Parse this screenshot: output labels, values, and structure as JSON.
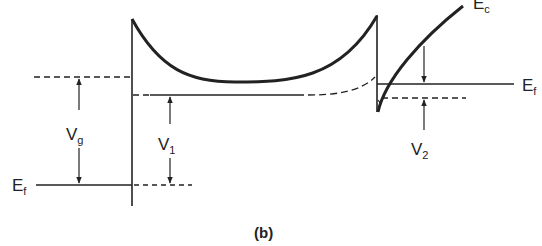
{
  "figure": {
    "caption": "(b)",
    "labels": {
      "vg_main": "V",
      "vg_sub": "g",
      "v1_main": "V",
      "v1_sub": "1",
      "v2_main": "V",
      "v2_sub": "2",
      "ef_left_main": "E",
      "ef_left_sub": "f",
      "ef_right_main": "E",
      "ef_right_sub": "f",
      "ec_main": "E",
      "ec_sub": "c"
    },
    "colors": {
      "ink": "#222222",
      "background": "#ffffff"
    }
  }
}
